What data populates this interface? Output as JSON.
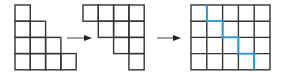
{
  "diagram": {
    "colors": {
      "grid_line": "#333333",
      "arrow": "#333333",
      "path": "#2a9bd8",
      "background": "#ffffff"
    },
    "left_shape": {
      "name": "staircase",
      "row_lengths": [
        1,
        2,
        3,
        4
      ]
    },
    "middle_shape": {
      "name": "rotated-staircase",
      "row_lengths_right_aligned": [
        4,
        3,
        2,
        1
      ]
    },
    "right_shape": {
      "name": "combined-rectangle",
      "rows": 4,
      "cols": 5,
      "path_steps": [
        "down at col 1",
        "right",
        "down",
        "right",
        "down",
        "right",
        "down"
      ]
    },
    "arrows": 2
  }
}
